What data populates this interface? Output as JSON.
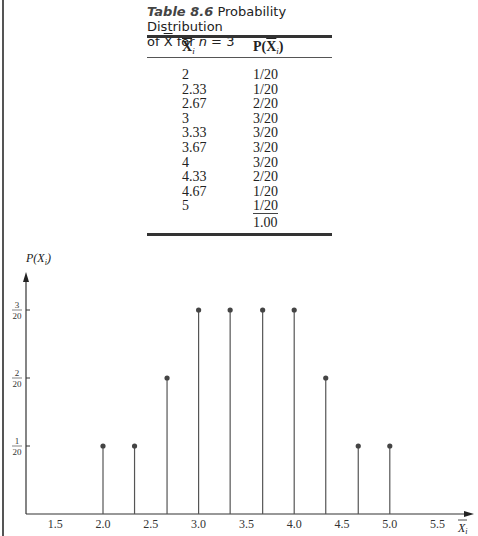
{
  "caption": {
    "table_number": "Table 8.6",
    "title_part1": "Probability Distribution",
    "title_part2_prefix": "of ",
    "title_xbar": "X",
    "title_part2_mid": " for ",
    "title_n": "n",
    "title_part2_suffix": " = 3"
  },
  "table": {
    "headers": {
      "col1_base": "X",
      "col1_sub": "i",
      "col2_prefix": "P(",
      "col2_base": "X",
      "col2_sub": "i",
      "col2_suffix": ")"
    },
    "rows": [
      {
        "x": "2",
        "p": "1/20"
      },
      {
        "x": "2.33",
        "p": "1/20"
      },
      {
        "x": "2.67",
        "p": "2/20"
      },
      {
        "x": "3",
        "p": "3/20"
      },
      {
        "x": "3.33",
        "p": "3/20"
      },
      {
        "x": "3.67",
        "p": "3/20"
      },
      {
        "x": "4",
        "p": "3/20"
      },
      {
        "x": "4.33",
        "p": "2/20"
      },
      {
        "x": "4.67",
        "p": "1/20"
      },
      {
        "x": "5",
        "p": "1/20"
      }
    ],
    "total": "1.00"
  },
  "chart_data": {
    "type": "bar",
    "subtype": "stem (lollipop)",
    "title": "",
    "xlabel": "X̄_i",
    "ylabel": "P(X_i)",
    "x": [
      2.0,
      2.33,
      2.67,
      3.0,
      3.33,
      3.67,
      4.0,
      4.33,
      4.67,
      5.0
    ],
    "values": [
      0.05,
      0.05,
      0.1,
      0.15,
      0.15,
      0.15,
      0.15,
      0.1,
      0.05,
      0.05
    ],
    "values_fraction": [
      "1/20",
      "1/20",
      "2/20",
      "3/20",
      "3/20",
      "3/20",
      "3/20",
      "2/20",
      "1/20",
      "1/20"
    ],
    "x_ticks": [
      "1.5",
      "2.0",
      "2.5",
      "3.0",
      "3.5",
      "4.0",
      "4.5",
      "5.0",
      "5.5"
    ],
    "y_ticks": [
      {
        "num": "1",
        "den": "20"
      },
      {
        "num": "2",
        "den": "20"
      },
      {
        "num": "3",
        "den": "20"
      }
    ],
    "xlim": [
      1.25,
      5.85
    ],
    "ylim": [
      0,
      0.175
    ],
    "grid": false,
    "legend": null
  }
}
